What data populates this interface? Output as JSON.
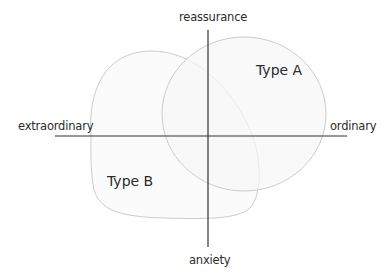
{
  "diagram": {
    "type": "quadrant-venn",
    "axes": {
      "top_label": "reassurance",
      "bottom_label": "anxiety",
      "left_label": "extraordinary",
      "right_label": "ordinary"
    },
    "regions": [
      {
        "label": "Type A",
        "quadrant": "top-right"
      },
      {
        "label": "Type B",
        "quadrant": "bottom-left"
      }
    ],
    "colors": {
      "axis": "#333333",
      "shape_stroke": "#c8c8c8",
      "shape_fill": "#fafafa",
      "text": "#2b2b2b"
    }
  }
}
